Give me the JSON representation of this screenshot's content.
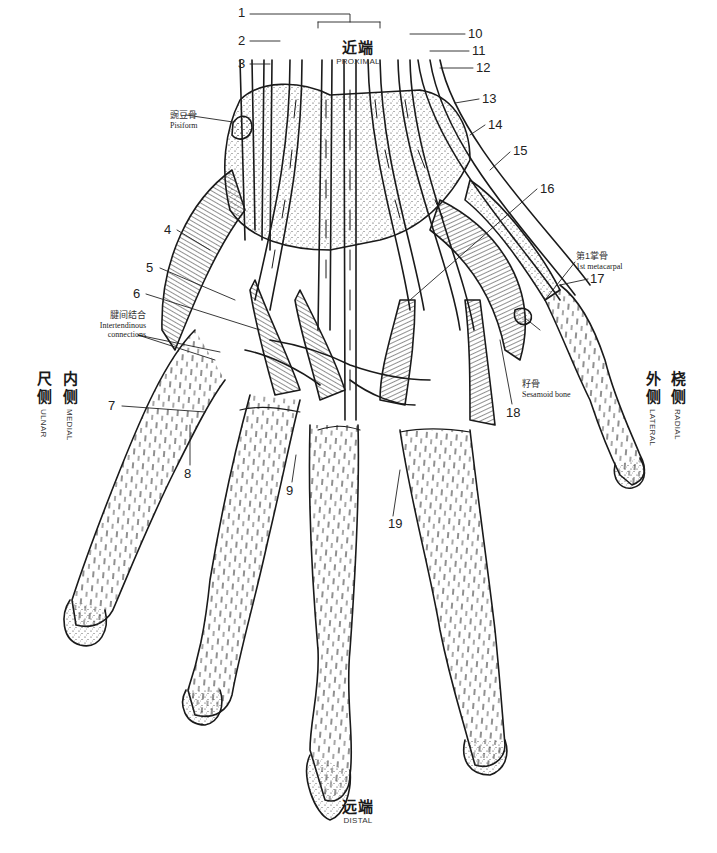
{
  "orientation": {
    "top": {
      "cn": "近端",
      "en": "PROXIMAL"
    },
    "bottom": {
      "cn": "远端",
      "en": "DISTAL"
    },
    "left_outer": {
      "cn": [
        "尺",
        "侧"
      ],
      "en": "ULNAR"
    },
    "left_inner": {
      "cn": [
        "内",
        "侧"
      ],
      "en": "MEDIAL"
    },
    "right_inner": {
      "cn": [
        "外",
        "侧"
      ],
      "en": "LATERAL"
    },
    "right_outer": {
      "cn": [
        "桡",
        "侧"
      ],
      "en": "RADIAL"
    }
  },
  "callouts": [
    {
      "n": "1",
      "x": 238,
      "y": 10
    },
    {
      "n": "2",
      "x": 238,
      "y": 37
    },
    {
      "n": "3",
      "x": 238,
      "y": 60
    },
    {
      "n": "4",
      "x": 164,
      "y": 226
    },
    {
      "n": "5",
      "x": 146,
      "y": 264
    },
    {
      "n": "6",
      "x": 133,
      "y": 290
    },
    {
      "n": "7",
      "x": 108,
      "y": 402
    },
    {
      "n": "8",
      "x": 183,
      "y": 470
    },
    {
      "n": "9",
      "x": 286,
      "y": 487
    },
    {
      "n": "10",
      "x": 468,
      "y": 30
    },
    {
      "n": "11",
      "x": 472,
      "y": 47
    },
    {
      "n": "12",
      "x": 476,
      "y": 64
    },
    {
      "n": "13",
      "x": 482,
      "y": 95
    },
    {
      "n": "14",
      "x": 488,
      "y": 121
    },
    {
      "n": "15",
      "x": 513,
      "y": 147
    },
    {
      "n": "16",
      "x": 540,
      "y": 185
    },
    {
      "n": "17",
      "x": 590,
      "y": 275
    },
    {
      "n": "18",
      "x": 508,
      "y": 409
    },
    {
      "n": "19",
      "x": 389,
      "y": 520
    }
  ],
  "annotations": {
    "pisiform": {
      "cn": "豌豆骨",
      "en": "Pisiform"
    },
    "intertendinous": {
      "cn": "腱间结合",
      "en": [
        "Intertendinous",
        "connections"
      ]
    },
    "first_metacarpal": {
      "cn": "第1掌骨",
      "en": "1st metacarpal"
    },
    "sesamoid": {
      "cn": "籽骨",
      "en": "Sesamoid bone"
    }
  },
  "colors": {
    "ink": "#1a1a1a",
    "background": "#ffffff",
    "label": "#333333"
  }
}
